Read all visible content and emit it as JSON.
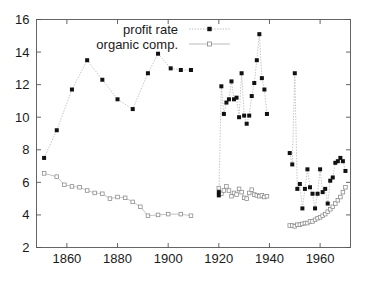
{
  "chart_data": {
    "type": "scatter",
    "title": "",
    "xlabel": "",
    "ylabel": "",
    "xlim": [
      1848,
      1972
    ],
    "ylim": [
      2,
      16
    ],
    "xticks": [
      1860,
      1880,
      1900,
      1920,
      1940,
      1960
    ],
    "xtick_labels": [
      "1860",
      "1880",
      "1900",
      "1920",
      "1940",
      "1960"
    ],
    "yticks": [
      2,
      4,
      6,
      8,
      10,
      12,
      14,
      16
    ],
    "ytick_labels": [
      "2",
      "4",
      "6",
      "8",
      "10",
      "12",
      "14",
      "16"
    ],
    "grid": false,
    "legend_position": "top-center",
    "frame": "box",
    "series": [
      {
        "name": "profit rate",
        "marker": "filled-square",
        "marker_color": "#111111",
        "line_style": "dotted",
        "line_color": "#b4b4b4",
        "segments": [
          {
            "x": [
              1851,
              1856,
              1862,
              1868,
              1874,
              1880,
              1886,
              1892,
              1896,
              1901,
              1905,
              1909
            ],
            "y": [
              7.5,
              9.2,
              11.7,
              13.5,
              12.3,
              11.1,
              10.5,
              12.7,
              13.9,
              13.0,
              12.9,
              12.9
            ]
          },
          {
            "x": [
              1920,
              1920,
              1921,
              1922,
              1923,
              1924,
              1925,
              1926,
              1927,
              1928,
              1929,
              1930,
              1931,
              1932,
              1933,
              1934,
              1935,
              1936,
              1937,
              1938,
              1939
            ],
            "y": [
              5.4,
              5.2,
              11.9,
              10.2,
              10.9,
              11.1,
              12.2,
              11.1,
              11.2,
              10.0,
              12.7,
              10.1,
              9.6,
              10.1,
              11.3,
              12.1,
              13.5,
              15.1,
              12.4,
              11.7,
              10.2
            ]
          },
          {
            "x": [
              1948,
              1949,
              1950,
              1951,
              1952,
              1953,
              1954,
              1955,
              1956,
              1957,
              1958,
              1959,
              1960,
              1961,
              1962,
              1963,
              1964,
              1965,
              1966,
              1967,
              1968,
              1969,
              1970
            ],
            "y": [
              7.8,
              7.1,
              12.7,
              5.6,
              5.9,
              4.4,
              5.6,
              6.8,
              5.7,
              5.3,
              4.4,
              5.3,
              6.8,
              5.4,
              5.6,
              4.7,
              6.1,
              6.3,
              7.2,
              7.3,
              7.5,
              7.3,
              6.7
            ]
          }
        ]
      },
      {
        "name": "organic comp.",
        "marker": "open-square",
        "marker_color": "#888888",
        "line_style": "solid",
        "line_color": "#b4b4b4",
        "segments": [
          {
            "x": [
              1851,
              1856,
              1859,
              1862,
              1865,
              1868,
              1871,
              1874,
              1877,
              1880,
              1883,
              1886,
              1889,
              1892,
              1896,
              1900,
              1905,
              1909
            ],
            "y": [
              6.55,
              6.35,
              5.85,
              5.75,
              5.7,
              5.5,
              5.35,
              5.3,
              5.0,
              5.1,
              5.05,
              4.8,
              4.5,
              3.95,
              4.0,
              4.05,
              4.05,
              3.95
            ]
          },
          {
            "x": [
              1920,
              1921,
              1922,
              1923,
              1924,
              1925,
              1926,
              1927,
              1928,
              1929,
              1930,
              1931,
              1932,
              1933,
              1934,
              1935,
              1936,
              1937,
              1938,
              1939
            ],
            "y": [
              5.65,
              5.3,
              5.5,
              5.75,
              5.5,
              5.15,
              5.35,
              5.25,
              5.6,
              5.4,
              5.05,
              5.0,
              5.35,
              5.55,
              5.25,
              5.2,
              5.15,
              5.2,
              5.1,
              5.15
            ]
          },
          {
            "x": [
              1948,
              1949,
              1950,
              1951,
              1952,
              1953,
              1954,
              1955,
              1956,
              1957,
              1958,
              1959,
              1960,
              1961,
              1962,
              1963,
              1964,
              1965,
              1966,
              1967,
              1968,
              1969,
              1970
            ],
            "y": [
              3.35,
              3.35,
              3.3,
              3.4,
              3.4,
              3.45,
              3.5,
              3.5,
              3.6,
              3.6,
              3.7,
              3.8,
              3.85,
              3.95,
              4.05,
              4.2,
              4.35,
              4.5,
              4.7,
              4.9,
              5.1,
              5.4,
              5.7
            ]
          }
        ]
      }
    ]
  },
  "legend": {
    "entries": [
      {
        "label": "profit rate"
      },
      {
        "label": "organic comp."
      }
    ]
  },
  "colors": {
    "axis": "#555555",
    "text": "#1a1a1a",
    "profit_marker": "#111111",
    "organic_marker": "#888888",
    "connector": "#b4b4b4",
    "background": "#ffffff"
  }
}
